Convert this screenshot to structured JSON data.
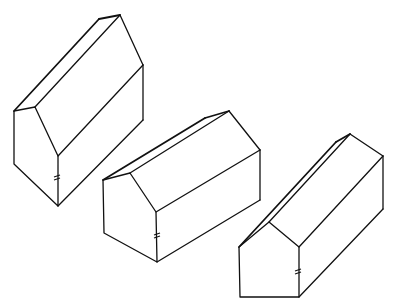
{
  "figure": {
    "stroke_color": "#111111",
    "background": "#ffffff",
    "houses": [
      {
        "id": "house-1",
        "front_face": [
          [
            14,
            111
          ],
          [
            35,
            107
          ],
          [
            58,
            156
          ],
          [
            58,
            206
          ],
          [
            14,
            164
          ]
        ],
        "back_ridge": [
          99,
          19
        ],
        "back_peak": [
          120,
          15
        ],
        "back_right_eave": [
          143,
          65
        ],
        "back_right_bottom": [
          143,
          120
        ],
        "hash_mark": [
          57,
          178
        ]
      },
      {
        "id": "house-2",
        "front_face": [
          [
            103,
            180
          ],
          [
            130,
            173
          ],
          [
            156,
            212
          ],
          [
            157,
            262
          ],
          [
            104,
            233
          ]
        ],
        "back_ridge": [
          205,
          118
        ],
        "back_peak": [
          229,
          111
        ],
        "back_right_eave": [
          260,
          150
        ],
        "back_right_bottom": [
          260,
          200
        ],
        "hash_mark": [
          157,
          236
        ]
      },
      {
        "id": "house-3",
        "front_face": [
          [
            239,
            247
          ],
          [
            269,
            222
          ],
          [
            299,
            247
          ],
          [
            299,
            297
          ],
          [
            240,
            297
          ]
        ],
        "back_ridge": [
          336,
          142
        ],
        "back_peak": [
          350,
          134
        ],
        "back_right_eave": [
          383,
          156
        ],
        "back_right_bottom": [
          383,
          209
        ],
        "hash_mark": [
          298,
          272
        ]
      }
    ]
  }
}
